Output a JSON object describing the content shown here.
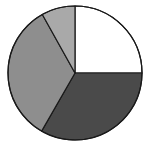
{
  "chart_data": {
    "type": "pie",
    "title": "",
    "categories": [
      "Slice A",
      "Slice B",
      "Slice C",
      "Slice D"
    ],
    "values": [
      25,
      33.3,
      33.6,
      8.1
    ],
    "colors": [
      "#ffffff",
      "#4a4a4a",
      "#8e8e8e",
      "#a9a9a9"
    ],
    "start_angle_deg": 0,
    "direction": "clockwise",
    "legend": "none",
    "labels_shown": false
  },
  "geometry": {
    "cx": 75,
    "cy": 73,
    "r": 67,
    "stroke": "#1a1a1a",
    "stroke_width": 1.2
  }
}
